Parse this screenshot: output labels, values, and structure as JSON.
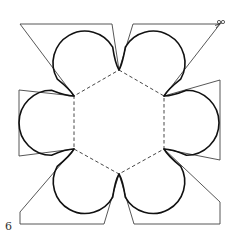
{
  "diagram": {
    "page_number": "6",
    "page_number_pos": [
      5,
      220
    ],
    "colors": {
      "background": "#ffffff",
      "cut_line": "#1a1a1a",
      "petal_line": "#111111",
      "fold_line": "#333333",
      "flap_line": "#444444"
    },
    "hexagon": {
      "style": "dashed",
      "vertices": [
        [
          119,
          70
        ],
        [
          164,
          96
        ],
        [
          164,
          149
        ],
        [
          119,
          174
        ],
        [
          74,
          149
        ],
        [
          74,
          96
        ]
      ]
    },
    "petals": [
      {
        "name": "top-left",
        "from": [
          74,
          96
        ],
        "to": [
          119,
          70
        ]
      },
      {
        "name": "top-right",
        "from": [
          119,
          70
        ],
        "to": [
          164,
          96
        ]
      },
      {
        "name": "right",
        "from": [
          164,
          96
        ],
        "to": [
          164,
          149
        ]
      },
      {
        "name": "bottom-right",
        "from": [
          164,
          149
        ],
        "to": [
          119,
          174
        ]
      },
      {
        "name": "bottom-left",
        "from": [
          119,
          174
        ],
        "to": [
          74,
          149
        ]
      },
      {
        "name": "left",
        "from": [
          74,
          149
        ],
        "to": [
          74,
          96
        ]
      }
    ],
    "flaps": [
      {
        "name": "top-left-flap",
        "points": [
          [
            74,
            96
          ],
          [
            20,
            24
          ],
          [
            112,
            24
          ],
          [
            119,
            70
          ]
        ]
      },
      {
        "name": "top-right-flap",
        "points": [
          [
            119,
            70
          ],
          [
            133,
            24
          ],
          [
            220,
            24
          ],
          [
            164,
            96
          ]
        ]
      },
      {
        "name": "right-flap",
        "points": [
          [
            164,
            96
          ],
          [
            220,
            80
          ],
          [
            220,
            160
          ],
          [
            164,
            149
          ]
        ]
      },
      {
        "name": "bottom-right-flap",
        "points": [
          [
            164,
            149
          ],
          [
            220,
            202
          ],
          [
            220,
            224
          ],
          [
            134,
            224
          ],
          [
            119,
            174
          ]
        ]
      },
      {
        "name": "bottom-left-flap",
        "points": [
          [
            119,
            174
          ],
          [
            104,
            224
          ],
          [
            20,
            224
          ],
          [
            20,
            212
          ],
          [
            74,
            149
          ]
        ]
      },
      {
        "name": "left-flap",
        "points": [
          [
            74,
            149
          ],
          [
            19,
            156
          ],
          [
            19,
            90
          ],
          [
            74,
            96
          ]
        ]
      }
    ],
    "scissors_icon": {
      "label": "scissors",
      "pos": [
        219,
        22
      ]
    }
  }
}
